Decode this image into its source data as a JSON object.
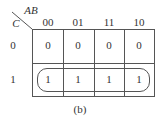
{
  "kmap": {
    "row_var": "C",
    "col_var": "AB",
    "col_headers": [
      "00",
      "01",
      "11",
      "10"
    ],
    "row_headers": [
      "0",
      "1"
    ],
    "cells": [
      [
        "0",
        "0",
        "0",
        "0"
      ],
      [
        "1",
        "1",
        "1",
        "1"
      ]
    ],
    "groupings": [
      {
        "row": 1,
        "cols": [
          0,
          1,
          2,
          3
        ],
        "shape": "rounded-rect"
      }
    ]
  },
  "caption": "(b)"
}
